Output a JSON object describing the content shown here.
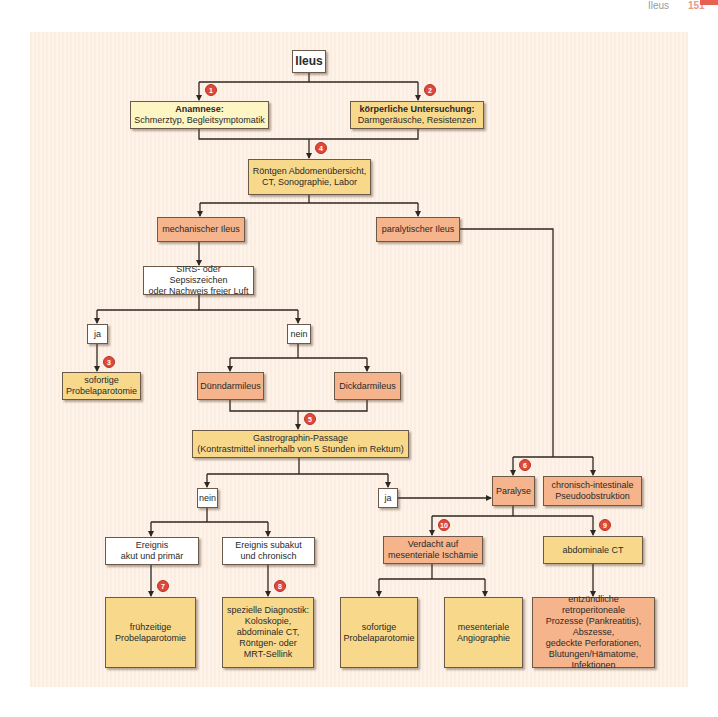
{
  "header": {
    "title": "Ileus",
    "page_number": "151"
  },
  "colors": {
    "panel_bg": "#fbeee2",
    "white_box": "#ffffff",
    "light_yellow_box": "#fdf5c4",
    "yellow_box": "#f8d98b",
    "salmon_box": "#f5b48b",
    "badge": "#e0483a",
    "line": "#2e2620"
  },
  "nodes": {
    "ileus": "Ileus",
    "anamnese_title": "Anamnese:",
    "anamnese_text": "Schmerztyp, Begleitsymptomatik",
    "koerperlich_title": "körperliche Untersuchung:",
    "koerperlich_text": "Darmgeräusche, Resistenzen",
    "roentgen_l1": "Röntgen Abdomenübersicht,",
    "roentgen_l2": "CT, Sonographie, Labor",
    "mechanisch": "mechanischer Ileus",
    "paralytisch": "paralytischer Ileus",
    "sirs_l1": "SIRS- oder Sepsiszeichen",
    "sirs_l2": "oder Nachweis freier Luft",
    "ja1": "ja",
    "nein1": "nein",
    "sofortige1_l1": "sofortige",
    "sofortige1_l2": "Probelaparotomie",
    "duenndarm": "Dünndarmileus",
    "dickdarm": "Dickdarmileus",
    "gastro_l1": "Gastrographin-Passage",
    "gastro_l2": "(Kontrastmittel innerhalb von 5 Stunden im Rektum)",
    "nein2": "nein",
    "ja2": "ja",
    "paralyse": "Paralyse",
    "chronisch_l1": "chronisch-intestinale",
    "chronisch_l2": "Pseudoobstruktion",
    "akut_l1": "Ereignis",
    "akut_l2": "akut und primär",
    "subakut_l1": "Ereignis subakut",
    "subakut_l2": "und chronisch",
    "verdacht_l1": "Verdacht auf",
    "verdacht_l2": "mesenteriale Ischämie",
    "abd_ct": "abdominale CT",
    "fruehzeitig_l1": "frühzeitige",
    "fruehzeitig_l2": "Probelaparotomie",
    "speziell": [
      "spezielle Diagnostik:",
      "Koloskopie,",
      "abdominale CT,",
      "Röntgen- oder",
      "MRT-Sellink"
    ],
    "sofortige2_l1": "sofortige",
    "sofortige2_l2": "Probelaparotomie",
    "angio_l1": "mesenteriale",
    "angio_l2": "Angiographie",
    "entzuendlich": [
      "entzündliche retroperitoneale",
      "Prozesse (Pankreatitis),",
      "Abszesse,",
      "gedeckte Perforationen,",
      "Blutungen/Hämatome,",
      "Infektionen"
    ]
  },
  "badges": {
    "b1": "1",
    "b2": "2",
    "b3": "3",
    "b4": "4",
    "b5": "5",
    "b6": "6",
    "b7": "7",
    "b8": "8",
    "b9": "9",
    "b10": "10"
  }
}
